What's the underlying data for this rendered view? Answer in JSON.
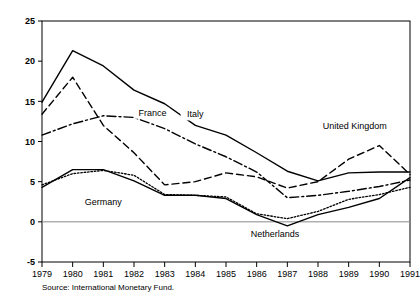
{
  "chart_data": {
    "type": "line",
    "title": "",
    "subtitle": "",
    "xlabel": "",
    "ylabel": "",
    "x": [
      1979,
      1980,
      1981,
      1982,
      1983,
      1984,
      1985,
      1986,
      1987,
      1988,
      1989,
      1990,
      1991
    ],
    "xtick_labels": [
      "1979",
      "1980",
      "1981",
      "1982",
      "1983",
      "1984",
      "1985",
      "1986",
      "1987",
      "1988",
      "1989",
      "1990",
      "1991"
    ],
    "ytick_labels": [
      "-5",
      "0",
      "5",
      "10",
      "15",
      "20",
      "25"
    ],
    "ytick_values": [
      -5,
      0,
      5,
      10,
      15,
      20,
      25
    ],
    "ylim": [
      -5,
      25
    ],
    "xlim": [
      1979,
      1991
    ],
    "grid": false,
    "legend_position": "inline-annotations",
    "zero_line": true,
    "series": [
      {
        "name": "Italy",
        "style": "solid",
        "values": [
          14.9,
          21.3,
          19.4,
          16.4,
          14.7,
          12.0,
          10.8,
          8.6,
          6.3,
          5.1,
          6.1,
          6.2,
          6.2
        ],
        "label_x": 1984.0,
        "label_y": 13.0
      },
      {
        "name": "United Kingdom",
        "style": "dashed",
        "values": [
          13.4,
          18.0,
          12.0,
          8.6,
          4.6,
          5.0,
          6.1,
          5.6,
          4.2,
          5.0,
          7.8,
          9.5,
          5.9
        ],
        "label_x": 1989.2,
        "label_y": 11.6
      },
      {
        "name": "France",
        "style": "dash-dot",
        "values": [
          10.8,
          12.2,
          13.2,
          13.0,
          11.6,
          9.7,
          8.1,
          6.2,
          3.0,
          3.3,
          3.8,
          4.4,
          5.2
        ],
        "label_x": 1982.6,
        "label_y": 13.2
      },
      {
        "name": "Netherlands",
        "style": "solid",
        "values": [
          4.3,
          6.5,
          6.5,
          5.1,
          3.3,
          3.3,
          2.9,
          0.9,
          -0.5,
          0.9,
          1.8,
          2.9,
          5.5
        ],
        "label_x": 1986.6,
        "label_y": -1.9
      },
      {
        "name": "Germany",
        "style": "dotted",
        "values": [
          4.6,
          6.0,
          6.4,
          5.8,
          3.4,
          3.3,
          3.1,
          1.0,
          0.4,
          1.3,
          2.8,
          3.4,
          4.3
        ],
        "label_x": 1981.0,
        "label_y": 2.1
      }
    ]
  },
  "source": {
    "text": "Source: International Monetary Fund."
  },
  "axis": {
    "y_top_label": "25",
    "y_bottom_label": "-5"
  }
}
